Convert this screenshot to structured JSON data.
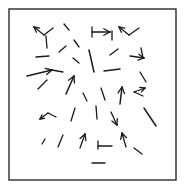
{
  "figure": {
    "width": 186,
    "height": 192,
    "background_color": "#ffffff",
    "stroke_color": "#1a1a1a",
    "frame": {
      "name": "plot-border",
      "x": 9,
      "y": 9,
      "width": 167,
      "height": 171,
      "stroke_color": "#2b2b2b",
      "stroke_width": 1.4,
      "fill_color": "#ffffff"
    },
    "focus_of_expansion": {
      "x": 86,
      "y": 88,
      "label": ""
    }
  },
  "chart_data": {
    "type": "scatter",
    "subtitle": "",
    "xlabel": "",
    "ylabel": "",
    "xlim": [
      9,
      176
    ],
    "ylim": [
      9,
      180
    ],
    "grid": false,
    "legend": [],
    "annotations": [],
    "tick_labels_x": [],
    "tick_labels_y": [],
    "vector_count": 42,
    "vectors": [
      {
        "x": 44,
        "y": 35,
        "dx": -10,
        "dy": -8,
        "head": true
      },
      {
        "x": 44,
        "y": 35,
        "dx": 9,
        "dy": -7,
        "head": false
      },
      {
        "x": 46,
        "y": 36,
        "dx": 1,
        "dy": 12,
        "head": false
      },
      {
        "x": 69,
        "y": 30,
        "dx": -5,
        "dy": -6,
        "head": false
      },
      {
        "x": 74,
        "y": 40,
        "dx": 5,
        "dy": 7,
        "head": false
      },
      {
        "x": 92,
        "y": 32,
        "dx": 18,
        "dy": 0,
        "head": true
      },
      {
        "x": 92,
        "y": 27,
        "dx": 0,
        "dy": 10,
        "head": false
      },
      {
        "x": 112,
        "y": 31,
        "dx": 0,
        "dy": 9,
        "head": false
      },
      {
        "x": 129,
        "y": 35,
        "dx": -10,
        "dy": -8,
        "head": true
      },
      {
        "x": 129,
        "y": 35,
        "dx": 10,
        "dy": -7,
        "head": false
      },
      {
        "x": 36,
        "y": 57,
        "dx": 13,
        "dy": -1,
        "head": false
      },
      {
        "x": 59,
        "y": 52,
        "dx": 7,
        "dy": -6,
        "head": false
      },
      {
        "x": 73,
        "y": 58,
        "dx": 6,
        "dy": 5,
        "head": false
      },
      {
        "x": 89,
        "y": 50,
        "dx": 5,
        "dy": 22,
        "head": false
      },
      {
        "x": 110,
        "y": 55,
        "dx": 8,
        "dy": -6,
        "head": false
      },
      {
        "x": 130,
        "y": 56,
        "dx": 14,
        "dy": 2,
        "head": true
      },
      {
        "x": 141,
        "y": 48,
        "dx": 2,
        "dy": 10,
        "head": false
      },
      {
        "x": 27,
        "y": 76,
        "dx": 25,
        "dy": -6,
        "head": true
      },
      {
        "x": 52,
        "y": 70,
        "dx": 11,
        "dy": 2,
        "head": false
      },
      {
        "x": 104,
        "y": 71,
        "dx": 16,
        "dy": -2,
        "head": false
      },
      {
        "x": 140,
        "y": 72,
        "dx": 6,
        "dy": 10,
        "head": false
      },
      {
        "x": 38,
        "y": 89,
        "dx": 9,
        "dy": -9,
        "head": false
      },
      {
        "x": 66,
        "y": 94,
        "dx": 8,
        "dy": -18,
        "head": true
      },
      {
        "x": 83,
        "y": 93,
        "dx": 4,
        "dy": 8,
        "head": false
      },
      {
        "x": 101,
        "y": 88,
        "dx": 4,
        "dy": 12,
        "head": false
      },
      {
        "x": 120,
        "y": 104,
        "dx": 2,
        "dy": -17,
        "head": true
      },
      {
        "x": 134,
        "y": 92,
        "dx": 11,
        "dy": -4,
        "head": true
      },
      {
        "x": 134,
        "y": 92,
        "dx": 9,
        "dy": 4,
        "head": false
      },
      {
        "x": 48,
        "y": 113,
        "dx": -8,
        "dy": 6,
        "head": true
      },
      {
        "x": 48,
        "y": 113,
        "dx": 8,
        "dy": 4,
        "head": false
      },
      {
        "x": 75,
        "y": 108,
        "dx": -4,
        "dy": 13,
        "head": false
      },
      {
        "x": 96,
        "y": 106,
        "dx": 1,
        "dy": 13,
        "head": false
      },
      {
        "x": 111,
        "y": 112,
        "dx": 6,
        "dy": 13,
        "head": true
      },
      {
        "x": 144,
        "y": 108,
        "dx": 12,
        "dy": 18,
        "head": false
      },
      {
        "x": 42,
        "y": 144,
        "dx": 3,
        "dy": -5,
        "head": false
      },
      {
        "x": 58,
        "y": 147,
        "dx": 5,
        "dy": -12,
        "head": false
      },
      {
        "x": 80,
        "y": 148,
        "dx": 5,
        "dy": -14,
        "head": true
      },
      {
        "x": 98,
        "y": 146,
        "dx": 14,
        "dy": 0,
        "head": false
      },
      {
        "x": 98,
        "y": 141,
        "dx": 0,
        "dy": 8,
        "head": false
      },
      {
        "x": 126,
        "y": 147,
        "dx": -4,
        "dy": -14,
        "head": true
      },
      {
        "x": 134,
        "y": 148,
        "dx": 8,
        "dy": 6,
        "head": false
      },
      {
        "x": 92,
        "y": 163,
        "dx": 13,
        "dy": 0,
        "head": false
      }
    ]
  }
}
